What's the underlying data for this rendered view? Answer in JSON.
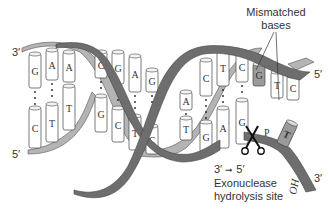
{
  "diagram": {
    "strand_labels": {
      "top_left": "3′",
      "bottom_left": "5′",
      "top_right": "5′",
      "bottom_right": "3′"
    },
    "annotations": {
      "mismatched_line1": "Mismatched",
      "mismatched_line2": "bases",
      "direction_from": "3′",
      "direction_arrow": "➞",
      "direction_to": "5′",
      "exonuclease_line1": "Exonuclease",
      "exonuclease_line2": "hydrolysis site",
      "hydroxyl": "HO"
    },
    "base_pairs": [
      {
        "top": "G",
        "bottom": "C"
      },
      {
        "top": "A",
        "bottom": "T"
      },
      {
        "top": "A",
        "bottom": "T"
      },
      {
        "top": "C",
        "bottom": "G"
      },
      {
        "top": "G",
        "bottom": "C"
      },
      {
        "top": "A",
        "bottom": "T"
      },
      {
        "top": "G",
        "bottom": "C"
      },
      {
        "top": "A",
        "bottom": "T"
      },
      {
        "top": "C",
        "bottom": "G"
      },
      {
        "top": "T",
        "bottom": "A"
      },
      {
        "top": "C",
        "bottom": "G"
      }
    ],
    "unpaired_top": [
      "G",
      "T",
      "C"
    ],
    "excised_base": "T",
    "colors": {
      "dark_backbone": "#6e6e6e",
      "light_backbone": "#b4b4b4",
      "mismatch_fill": "#9a9a9a",
      "base_fill": "#ffffff",
      "outline": "#444444"
    }
  }
}
